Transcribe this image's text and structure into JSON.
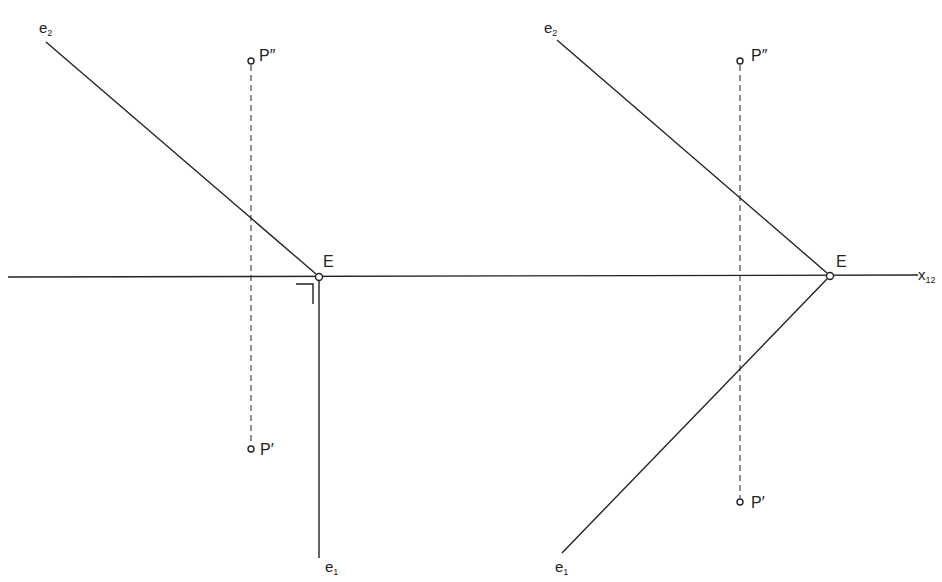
{
  "diagram": {
    "axis_label": "x",
    "axis_sub": "12",
    "left": {
      "e2": {
        "base": "e",
        "sub": "2"
      },
      "e1": {
        "base": "e",
        "sub": "1"
      },
      "E": "E",
      "P2": "P″",
      "P1": "P′"
    },
    "right": {
      "e2": {
        "base": "e",
        "sub": "2"
      },
      "e1": {
        "base": "e",
        "sub": "1"
      },
      "E": "E",
      "P2": "P″",
      "P1": "P′"
    }
  }
}
